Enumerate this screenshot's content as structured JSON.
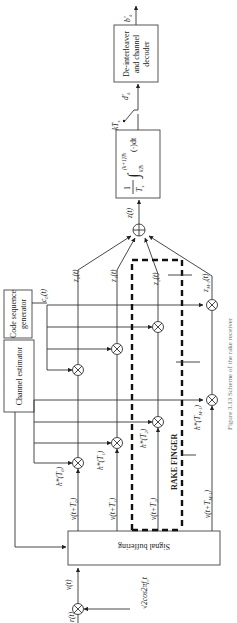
{
  "diagram": {
    "orientation": "rotated-90-ccw",
    "blocks": {
      "signal_buffering": "Signal buffering",
      "channel_estimator": "Channel estimator",
      "code_generator_line1": "Code sequence",
      "code_generator_line2": "generator",
      "deinterleaver_line1": "De-interleaver",
      "deinterleaver_line2": "and channel",
      "deinterleaver_line3": "decoder",
      "integrator_frac_num": "1",
      "integrator_frac_den": "T",
      "integrator_frac_den_sub": "s",
      "integrator_upper": "(k+1)T",
      "integrator_upper_sub": "s",
      "integrator_lower": "kT",
      "integrator_lower_sub": "s",
      "integrator_body": "(·)dt"
    },
    "labels": {
      "input": "r(t)",
      "mixer_ref": "√2cos2πf",
      "mixer_ref_sub": "c",
      "mixer_ref_tail": "t",
      "baseband": "v(t)",
      "delay_0": "v(t+T₀)",
      "delay_1": "v(t+T₁)",
      "delay_2": "v(t+T₂)",
      "delay_m": "v(t+T_{M-1})",
      "weight_0": "h*(T₀)",
      "weight_1": "h*(T₁)",
      "weight_2": "h*(T₂)",
      "weight_m": "h*(T_{M-1})",
      "code": "c₀(t)",
      "z0": "z₀(t)",
      "z1": "z₁(t)",
      "z2": "z₂(t)",
      "zm": "z_{M-1}(t)",
      "sum": "z(t)",
      "sampler": "kT",
      "sampler_sub": "s",
      "soft_out": "d'",
      "soft_out_sub": "k",
      "final_out": "b'",
      "final_out_sub": "k",
      "rake_finger": "RAKE FINGER"
    },
    "caption": "Figure 3.13   Scheme of the rake receiver"
  }
}
